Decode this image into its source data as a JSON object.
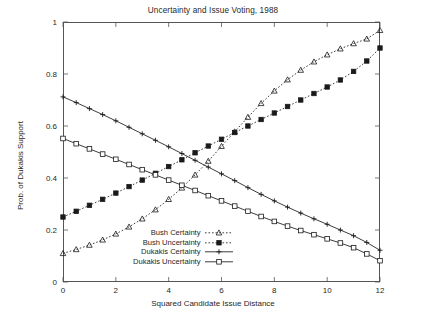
{
  "chart_data": {
    "type": "line",
    "title": "Uncertainty and Issue Voting, 1988",
    "xlabel": "Squared Candidate Issue Distance",
    "ylabel": "Prob. of Dukakis Support",
    "xlim": [
      0,
      12
    ],
    "ylim": [
      0,
      1
    ],
    "xticks": [
      0,
      2,
      4,
      6,
      8,
      10,
      12
    ],
    "yticks": [
      0,
      0.2,
      0.4,
      0.6,
      0.8,
      1
    ],
    "xtick_labels": [
      "0",
      "2",
      "4",
      "6",
      "8",
      "10",
      "12"
    ],
    "ytick_labels": [
      "0",
      "0.2",
      "0.4",
      "0.6",
      "0.8",
      "1"
    ],
    "grid": false,
    "legend_position": "lower-center",
    "x": [
      0,
      0.5,
      1,
      1.5,
      2,
      2.5,
      3,
      3.5,
      4,
      4.5,
      5,
      5.5,
      6,
      6.5,
      7,
      7.5,
      8,
      8.5,
      9,
      9.5,
      10,
      10.5,
      11,
      11.5,
      12
    ],
    "series": [
      {
        "name": "Bush Certainty",
        "marker": "triangle",
        "linestyle": "dotted",
        "color": "#1a1a1a",
        "values": [
          0.11,
          0.125,
          0.142,
          0.162,
          0.185,
          0.212,
          0.243,
          0.278,
          0.318,
          0.362,
          0.412,
          0.465,
          0.522,
          0.578,
          0.634,
          0.687,
          0.735,
          0.778,
          0.815,
          0.847,
          0.874,
          0.897,
          0.917,
          0.935,
          0.968
        ]
      },
      {
        "name": "Bush Uncertainty",
        "marker": "square-filled",
        "linestyle": "dotted",
        "color": "#1a1a1a",
        "values": [
          0.25,
          0.272,
          0.295,
          0.318,
          0.342,
          0.367,
          0.392,
          0.418,
          0.444,
          0.47,
          0.497,
          0.523,
          0.549,
          0.575,
          0.6,
          0.625,
          0.65,
          0.675,
          0.7,
          0.725,
          0.75,
          0.777,
          0.81,
          0.85,
          0.9
        ]
      },
      {
        "name": "Dukakis Certainty",
        "marker": "plus",
        "linestyle": "solid",
        "color": "#1a1a1a",
        "values": [
          0.712,
          0.69,
          0.667,
          0.644,
          0.62,
          0.595,
          0.57,
          0.545,
          0.52,
          0.494,
          0.468,
          0.442,
          0.416,
          0.39,
          0.363,
          0.337,
          0.312,
          0.288,
          0.265,
          0.243,
          0.222,
          0.2,
          0.178,
          0.152,
          0.122
        ]
      },
      {
        "name": "Dukakis Uncertainty",
        "marker": "square-open",
        "linestyle": "solid",
        "color": "#1a1a1a",
        "values": [
          0.552,
          0.532,
          0.512,
          0.492,
          0.472,
          0.452,
          0.432,
          0.412,
          0.392,
          0.372,
          0.352,
          0.332,
          0.312,
          0.292,
          0.272,
          0.252,
          0.233,
          0.215,
          0.198,
          0.182,
          0.166,
          0.15,
          0.132,
          0.108,
          0.082
        ]
      }
    ]
  }
}
